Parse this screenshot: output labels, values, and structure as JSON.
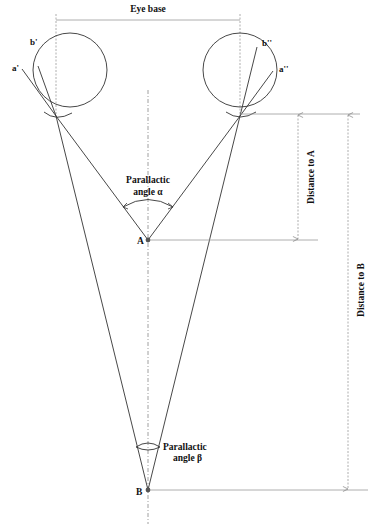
{
  "colors": {
    "line": "#333333",
    "guide": "#9a9a9a",
    "text": "#111111",
    "background": "#ffffff"
  },
  "labels": {
    "eye_base": "Eye base",
    "left_eye_a": "a'",
    "left_eye_b": "b'",
    "right_eye_a": "a''",
    "right_eye_b": "b''",
    "angle_alpha_line1": "Parallactic",
    "angle_alpha_line2": "angle α",
    "angle_beta_line1": "Parallactic",
    "angle_beta_line2": "angle β",
    "point_a": "A",
    "point_b": "B",
    "distance_a": "Distance to A",
    "distance_b": "Distance to B"
  },
  "geometry": {
    "left_eye": {
      "cx": 70,
      "cy": 70,
      "r": 37,
      "focal_point": [
        56,
        116
      ]
    },
    "right_eye": {
      "cx": 240,
      "cy": 70,
      "r": 37,
      "focal_point": [
        240,
        116
      ]
    },
    "point_a": [
      148,
      240
    ],
    "point_b": [
      148,
      490
    ],
    "midline_x": 148,
    "eye_base_y": 20
  }
}
